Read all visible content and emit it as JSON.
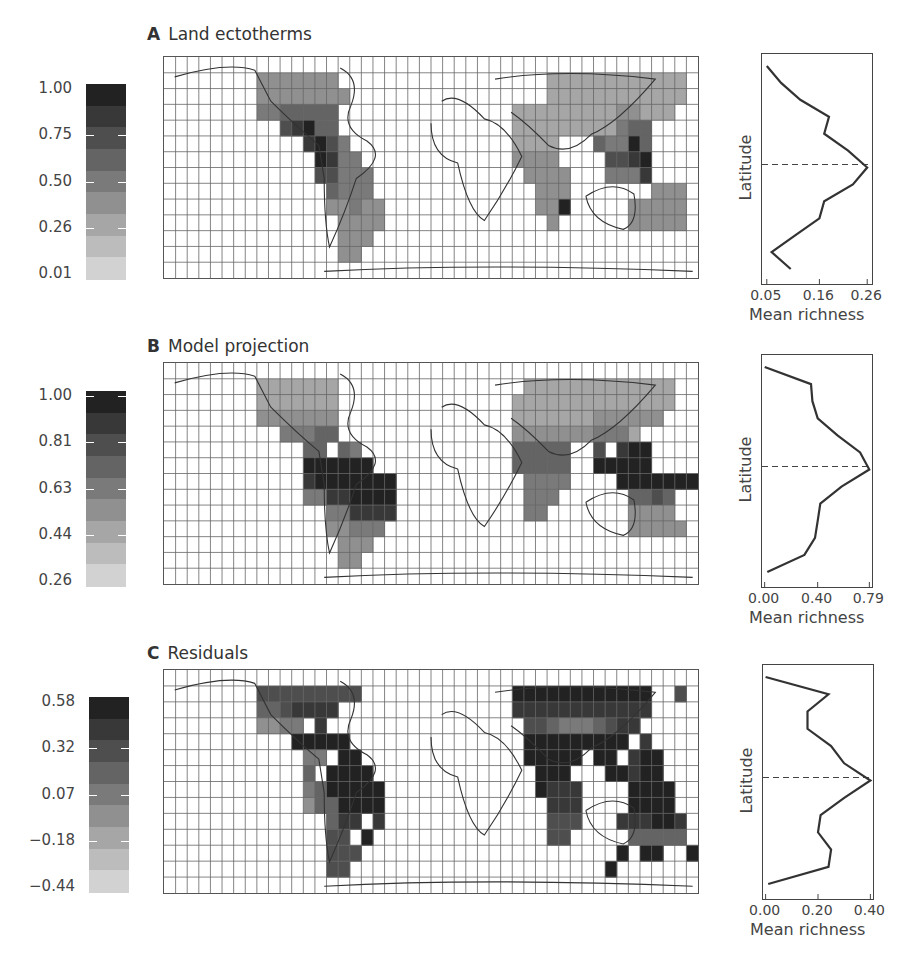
{
  "panels": [
    {
      "id": "A",
      "letter": "A",
      "title": "Land ectotherms",
      "colorbar": {
        "ticks": [
          "1.00",
          "0.75",
          "0.50",
          "0.26",
          "0.01"
        ]
      },
      "profile": {
        "ylabel": "Latitude",
        "xticks": [
          "0.05",
          "0.16",
          "0.26"
        ],
        "xlabel": "Mean richness"
      }
    },
    {
      "id": "B",
      "letter": "B",
      "title": "Model projection",
      "colorbar": {
        "ticks": [
          "1.00",
          "0.81",
          "0.63",
          "0.44",
          "0.26"
        ]
      },
      "profile": {
        "ylabel": "Latitude",
        "xticks": [
          "0.00",
          "0.40",
          "0.79"
        ],
        "xlabel": "Mean richness"
      }
    },
    {
      "id": "C",
      "letter": "C",
      "title": "Residuals",
      "colorbar": {
        "ticks": [
          "0.58",
          "0.32",
          "0.07",
          "−0.18",
          "−0.44"
        ]
      },
      "profile": {
        "ylabel": "Latitude",
        "xticks": [
          "0.00",
          "0.20",
          "0.40"
        ],
        "xlabel": "Mean richness"
      }
    }
  ],
  "chart_data": [
    {
      "type": "heatmap",
      "title": "A Land ectotherms",
      "legend": {
        "type": "colorbar",
        "ticks": [
          1.0,
          0.75,
          0.5,
          0.26,
          0.01
        ],
        "range": [
          0.01,
          1.0
        ],
        "colormap": "grayscale (dark=high)"
      },
      "grid": {
        "columns": 46,
        "rows": 14
      },
      "description": "Global equal-area grid of land ectotherm species richness; highest values in Central America, northwestern South America, Madagascar cell, and Southeast Asia."
    },
    {
      "type": "line",
      "title": "A Latitudinal profile",
      "xlabel": "Mean richness",
      "ylabel": "Latitude",
      "xticks": [
        0.05,
        0.16,
        0.26
      ],
      "xlim": [
        0.04,
        0.27
      ],
      "equator_dashed_line": true,
      "series": [
        {
          "name": "Land ectotherms",
          "lat_index": [
            0,
            1,
            2,
            3,
            4,
            5,
            6,
            7,
            8,
            9,
            10,
            11,
            12,
            13
          ],
          "values": [
            0.05,
            0.08,
            0.12,
            0.18,
            0.17,
            0.22,
            0.26,
            0.23,
            0.17,
            0.16,
            0.11,
            0.06,
            0.1
          ]
        }
      ]
    },
    {
      "type": "heatmap",
      "title": "B Model projection",
      "legend": {
        "type": "colorbar",
        "ticks": [
          1.0,
          0.81,
          0.63,
          0.44,
          0.26
        ],
        "range": [
          0.26,
          1.0
        ],
        "colormap": "grayscale (dark=high)"
      },
      "grid": {
        "columns": 46,
        "rows": 14
      },
      "description": "Model-projected richness; highest in Amazon basin and Indo-Malay region."
    },
    {
      "type": "line",
      "title": "B Latitudinal profile",
      "xlabel": "Mean richness",
      "ylabel": "Latitude",
      "xticks": [
        0.0,
        0.4,
        0.79
      ],
      "xlim": [
        -0.02,
        0.81
      ],
      "equator_dashed_line": true,
      "series": [
        {
          "name": "Model projection",
          "values": [
            0.0,
            0.35,
            0.36,
            0.4,
            0.55,
            0.72,
            0.79,
            0.58,
            0.42,
            0.4,
            0.38,
            0.3,
            0.02
          ]
        }
      ]
    },
    {
      "type": "heatmap",
      "title": "C Residuals",
      "legend": {
        "type": "colorbar",
        "ticks": [
          0.58,
          0.32,
          0.07,
          -0.18,
          -0.44
        ],
        "range": [
          -0.44,
          0.58
        ],
        "colormap": "grayscale (dark=high)"
      },
      "grid": {
        "columns": 46,
        "rows": 14
      },
      "description": "Residuals (observed minus projected); dark positive residuals across tropical South America, Africa, South Asia and Australia."
    },
    {
      "type": "line",
      "title": "C Latitudinal profile",
      "xlabel": "Mean richness",
      "ylabel": "Latitude",
      "xticks": [
        0.0,
        0.2,
        0.4
      ],
      "xlim": [
        -0.01,
        0.41
      ],
      "equator_dashed_line": true,
      "series": [
        {
          "name": "Residuals",
          "values": [
            0.0,
            0.24,
            0.16,
            0.16,
            0.25,
            0.3,
            0.4,
            0.3,
            0.21,
            0.2,
            0.25,
            0.24,
            0.01
          ]
        }
      ]
    }
  ],
  "maps": {
    "cols": 46,
    "rows": 14,
    "A": [
      "..............................................",
      "........4444444..................333333333333.",
      "........44444444.................333333333333.",
      "........5566666...............33333333344333..",
      "..........78966...............333333333566....",
      "............8975..............3333...65596....",
      ".............9855.............4444....7789....",
      ".............77555.............4444...5558....",
      "..............6555..............444.......444.",
      "..............44544.............449.....44444.",
      "...............4444..............4......44444.",
      "...............444...........................",
      "...............44.............................",
      ".............................................."
    ],
    "B": [
      "..............................................",
      "........3333333................3333333333333..",
      "........3333333...............33333333333333..",
      "........4444444...............3333333444444...",
      "..........55566...............44444445553.....",
      "............66.65.............66666..7.899....",
      "............999999............66666..99999....",
      "............89999999...........5555....9999999.",
      "............55889999...........555......6676..",
      "..............558888...........55.......4444..",
      "..............44555.....................44444.",
      "...............444............................",
      "...............44.............................",
      ".............................................."
    ],
    "C": [
      "..............................................",
      "........777777777.............999999999999..7.",
      "........6678888...............888888888888....",
      "........4455.8.................7765556788.....",
      "...........99999...............999999999.8....",
      "............55.99..............99999.99.899...",
      "............6.9999..............999...99899...",
      "............5699999.............9888....9999..",
      "............4669999..............888....9999..",
      "..............688.8..............777...888998.",
      "..............77.9...............77.....66666.",
      "..............777......................9.99..9",
      "..............77......................9.......",
      ".............................................."
    ]
  }
}
